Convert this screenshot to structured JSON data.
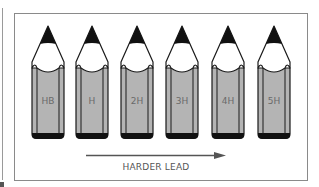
{
  "diagram": {
    "pencils": [
      {
        "grade": "HB"
      },
      {
        "grade": "H"
      },
      {
        "grade": "2H"
      },
      {
        "grade": "3H"
      },
      {
        "grade": "4H"
      },
      {
        "grade": "5H"
      }
    ],
    "arrow": {
      "label": "HARDER LEAD",
      "direction": "right"
    },
    "colors": {
      "body": "#b4b4b4",
      "lead": "#111111",
      "outline": "#1a1a1a",
      "frame": "#8a8a8a"
    }
  }
}
